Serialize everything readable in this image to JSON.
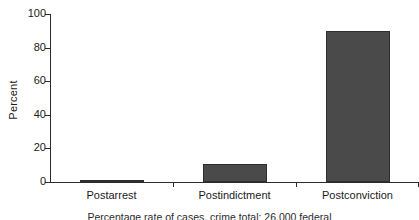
{
  "chart_data": {
    "type": "bar",
    "title": "",
    "subtitle": "",
    "categories": [
      "Postarrest",
      "Postindictment",
      "Postconviction"
    ],
    "values": [
      1,
      11,
      90
    ],
    "series": [
      {
        "name": "Percent",
        "values": [
          1,
          11,
          90
        ]
      }
    ],
    "xlabel": "",
    "ylabel": "Percent",
    "ylim": [
      0,
      100
    ],
    "yticks": [
      0,
      20,
      40,
      60,
      80,
      100
    ],
    "ytick_labels": [
      "0",
      "20",
      "40",
      "60",
      "80",
      "100"
    ],
    "grid": false,
    "legend": false,
    "legend_position": "none",
    "bar_color": "#4a4a4a",
    "bar_edge_color": "#2e2e2e",
    "axis_color": "#2b2b2b",
    "background": "#ffffff"
  },
  "caption": {
    "text": "Percentage rate of cases, crime total: 26,000 federal"
  }
}
